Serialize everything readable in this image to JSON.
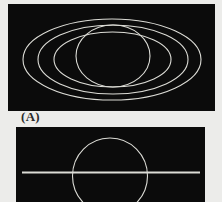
{
  "figure": {
    "label": "(A)",
    "background_color": "#ececea",
    "panel_color": "#0b0b0b",
    "line_color": "#dcdcd6",
    "top_panel": {
      "description": "Sphere with three concentric elliptical rings (Saturn-like)",
      "rect": {
        "x": 8,
        "y": 4,
        "w": 207,
        "h": 107
      },
      "shapes": [
        {
          "type": "ellipse",
          "name": "outer-ring",
          "cx": 112,
          "cy": 59.5,
          "rx": 89,
          "ry": 40.5
        },
        {
          "type": "ellipse",
          "name": "middle-ring",
          "cx": 113,
          "cy": 59.5,
          "rx": 75,
          "ry": 34.5
        },
        {
          "type": "ellipse",
          "name": "inner-ring",
          "cx": 112.5,
          "cy": 59.5,
          "rx": 58.5,
          "ry": 27.5
        },
        {
          "type": "ellipse",
          "name": "sphere",
          "cx": 113,
          "cy": 56,
          "rx": 37,
          "ry": 31
        }
      ]
    },
    "bottom_panel": {
      "description": "Sphere with edge-on ring as a horizontal line",
      "rect": {
        "x": 16,
        "y": 127,
        "w": 189,
        "h": 75
      },
      "shapes": [
        {
          "type": "ellipse",
          "name": "sphere",
          "cx": 110,
          "cy": 176,
          "rx": 37.5,
          "ry": 38
        },
        {
          "type": "line",
          "name": "edge-on-ring",
          "x1": 22,
          "y1": 172.5,
          "x2": 200,
          "y2": 172.5
        }
      ]
    }
  }
}
